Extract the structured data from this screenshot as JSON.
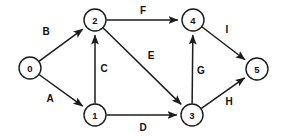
{
  "diagram": {
    "type": "directed-graph",
    "title": "",
    "background_color": "#ffffff",
    "stroke_color": "#1b1b1b",
    "node_radius": 11,
    "nodes": [
      {
        "id": "0",
        "label": "0",
        "x": 30,
        "y": 68
      },
      {
        "id": "1",
        "label": "1",
        "x": 95,
        "y": 115
      },
      {
        "id": "2",
        "label": "2",
        "x": 95,
        "y": 20
      },
      {
        "id": "3",
        "label": "3",
        "x": 192,
        "y": 115
      },
      {
        "id": "4",
        "label": "4",
        "x": 193,
        "y": 20
      },
      {
        "id": "5",
        "label": "5",
        "x": 257,
        "y": 69
      }
    ],
    "edges": [
      {
        "id": "A",
        "label": "A",
        "from": "0",
        "to": "1",
        "label_x": 50,
        "label_y": 98,
        "directed": true
      },
      {
        "id": "B",
        "label": "B",
        "from": "0",
        "to": "2",
        "label_x": 46,
        "label_y": 31,
        "directed": true
      },
      {
        "id": "C",
        "label": "C",
        "from": "1",
        "to": "2",
        "label_x": 104,
        "label_y": 68,
        "directed": true
      },
      {
        "id": "D",
        "label": "D",
        "from": "1",
        "to": "3",
        "label_x": 143,
        "label_y": 127,
        "directed": true
      },
      {
        "id": "E",
        "label": "E",
        "from": "2",
        "to": "3",
        "label_x": 151,
        "label_y": 55,
        "directed": true
      },
      {
        "id": "F",
        "label": "F",
        "from": "2",
        "to": "4",
        "label_x": 143,
        "label_y": 10,
        "directed": true
      },
      {
        "id": "G",
        "label": "G",
        "from": "3",
        "to": "4",
        "label_x": 201,
        "label_y": 70,
        "directed": true
      },
      {
        "id": "H",
        "label": "H",
        "from": "3",
        "to": "5",
        "label_x": 229,
        "label_y": 101,
        "directed": true
      },
      {
        "id": "I",
        "label": "I",
        "from": "4",
        "to": "5",
        "label_x": 227,
        "label_y": 29,
        "directed": true
      }
    ]
  }
}
